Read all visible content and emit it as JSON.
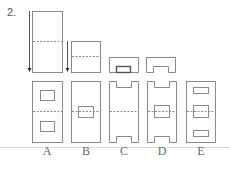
{
  "question": {
    "number": "2."
  },
  "options": [
    {
      "label": "A"
    },
    {
      "label": "B"
    },
    {
      "label": "C"
    },
    {
      "label": "D"
    },
    {
      "label": "E"
    }
  ],
  "colors": {
    "stroke": "#8a8a8a",
    "dashed": "#9a9a9a",
    "baseline": "#d8d8d8",
    "arrow": "#555555"
  }
}
